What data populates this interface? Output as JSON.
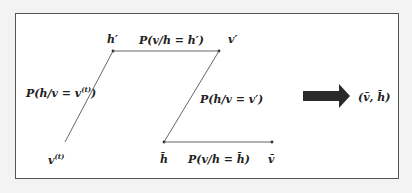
{
  "diagram": {
    "nodes": {
      "h_prime": "h′",
      "v_prime": "v′",
      "v_t_base": "v",
      "v_t_sup": "(t)",
      "h_bar": "h̄",
      "v_bar": "v̄"
    },
    "edges": {
      "p_h_given_vt_prefix": "P(h/v = v",
      "p_h_given_vt_sup": "(t)",
      "p_h_given_vt_suffix": ")",
      "p_v_given_hprime": "P(v/h = h′)",
      "p_h_given_vprime": "P(h/v = v′)",
      "p_v_given_hbar": "P(v/h = h̄)"
    },
    "result": "(v̄, h̄)",
    "colors": {
      "line": "#444444",
      "big_arrow": "#2a2a2a",
      "frame": "#555555",
      "background": "#ffffff"
    }
  }
}
